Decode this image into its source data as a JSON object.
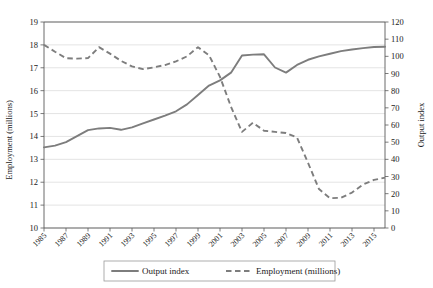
{
  "chart_data": {
    "type": "line",
    "title": "",
    "xlabel": "",
    "ylabel": "Employment (millions)",
    "y2label": "Output index",
    "grid": true,
    "legend_position": "bottom",
    "x": [
      1985,
      1986,
      1987,
      1988,
      1989,
      1990,
      1991,
      1992,
      1993,
      1994,
      1995,
      1996,
      1997,
      1998,
      1999,
      2000,
      2001,
      2002,
      2003,
      2004,
      2005,
      2006,
      2007,
      2008,
      2009,
      2010,
      2011,
      2012,
      2013,
      2014,
      2015,
      2016
    ],
    "xlim": [
      1985,
      2016
    ],
    "xticks": [
      1985,
      1987,
      1989,
      1991,
      1993,
      1995,
      1997,
      1999,
      2001,
      2003,
      2005,
      2007,
      2009,
      2011,
      2013,
      2015
    ],
    "ylim": [
      10,
      19
    ],
    "yticks": [
      10,
      11,
      12,
      13,
      14,
      15,
      16,
      17,
      18,
      19
    ],
    "y2lim": [
      0,
      120
    ],
    "y2ticks": [
      0,
      10,
      20,
      30,
      40,
      50,
      60,
      70,
      80,
      90,
      100,
      110,
      120
    ],
    "series": [
      {
        "name": "Output index",
        "axis": "right",
        "style": "solid",
        "color": "#7d7d7d",
        "values": [
          47.0,
          48.0,
          50.0,
          53.5,
          57.0,
          58.0,
          58.3,
          57.2,
          58.6,
          61.0,
          63.2,
          65.5,
          68.0,
          72.0,
          77.5,
          83.0,
          86.0,
          90.5,
          100.5,
          101.0,
          101.2,
          93.5,
          90.5,
          95.0,
          98.0,
          100.0,
          101.5,
          103.0,
          104.0,
          104.8,
          105.4,
          105.6
        ]
      },
      {
        "name": "Employment (millions)",
        "axis": "left",
        "style": "dashed",
        "color": "#7d7d7d",
        "values": [
          18.0,
          17.7,
          17.42,
          17.4,
          17.42,
          17.9,
          17.62,
          17.3,
          17.06,
          16.94,
          17.02,
          17.12,
          17.28,
          17.5,
          17.9,
          17.55,
          16.6,
          15.3,
          14.2,
          14.6,
          14.25,
          14.2,
          14.15,
          13.95,
          12.85,
          11.7,
          11.3,
          11.32,
          11.55,
          11.9,
          12.1,
          12.2
        ]
      }
    ],
    "legend": [
      {
        "label": "Output index",
        "style": "solid"
      },
      {
        "label": "Employment (millions)",
        "style": "dashed"
      }
    ]
  },
  "axes": {
    "left_title": "Employment (millions)",
    "right_title": "Output index"
  }
}
